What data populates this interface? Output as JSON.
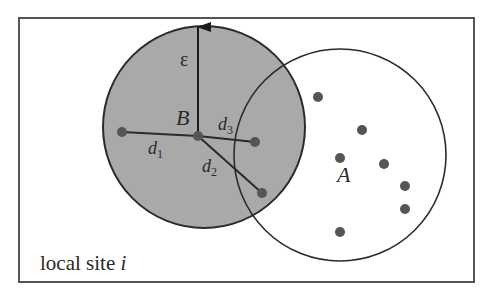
{
  "diagram": {
    "title": "local site i",
    "frame": {
      "x": 19,
      "y": 18,
      "width": 455,
      "height": 264,
      "stroke": "#555555"
    },
    "colors": {
      "circle_b_fill": "#a9a9a9",
      "stroke": "#2b2b2b",
      "dot": "#555555"
    },
    "circle_b": {
      "label": "B",
      "cx": 204,
      "cy": 127,
      "r": 101
    },
    "circle_a": {
      "label": "A",
      "cx": 340,
      "cy": 155,
      "r": 106
    },
    "epsilon_label": "ε",
    "center_point": {
      "x": 198,
      "y": 136
    },
    "distances": [
      {
        "label": "d",
        "sub": "1",
        "to": {
          "x": 122,
          "y": 132
        }
      },
      {
        "label": "d",
        "sub": "2",
        "to": {
          "x": 262,
          "y": 193
        }
      },
      {
        "label": "d",
        "sub": "3",
        "to": {
          "x": 255,
          "y": 142
        }
      }
    ],
    "points_a": [
      {
        "x": 318,
        "y": 97
      },
      {
        "x": 362,
        "y": 130
      },
      {
        "x": 340,
        "y": 158
      },
      {
        "x": 384,
        "y": 164
      },
      {
        "x": 405,
        "y": 186
      },
      {
        "x": 405,
        "y": 209
      },
      {
        "x": 340,
        "y": 232
      }
    ],
    "caption": {
      "text": "local site ",
      "italic": "i"
    }
  }
}
